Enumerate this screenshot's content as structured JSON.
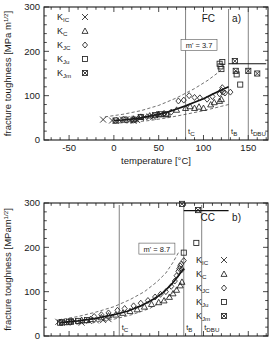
{
  "figure": {
    "panels": [
      "a",
      "b"
    ]
  },
  "chart_data": [
    {
      "type": "scatter",
      "panel_id": "a",
      "panel_label": "a)",
      "material_label": "FC",
      "title": "FC a)",
      "xlabel": "temperature  [°C]",
      "ylabel": "fracture toughness [MPa m",
      "ylabel_exponent": "1/2",
      "ylabel_tail": "]",
      "xlim": [
        -78,
        172
      ],
      "ylim": [
        0,
        300
      ],
      "xticks": [
        -50,
        0,
        50,
        100,
        150
      ],
      "xticklabels": [
        "-50",
        "0",
        "50",
        "100",
        "150"
      ],
      "yticks": [
        0,
        100,
        200,
        300
      ],
      "yticklabels": [
        "0",
        "100",
        "200",
        "300"
      ],
      "xminor_step": 10,
      "yminor_step": 20,
      "grid": false,
      "annotation": {
        "text": "m' = 3.7",
        "x": 95,
        "y": 213
      },
      "reference_lines": [
        {
          "name": "t_C",
          "label_main": "t",
          "label_sub": "C",
          "x": 80
        },
        {
          "name": "t_B",
          "label_main": "t",
          "label_sub": "B",
          "x": 128
        },
        {
          "name": "t_DBU",
          "label_main": "t",
          "label_sub": "DBU",
          "x": 150
        }
      ],
      "horizontal_bar": {
        "y": 172,
        "x_start": 128,
        "x_end": 170
      },
      "legend": {
        "position": "top-left",
        "entries": [
          {
            "label_main": "K",
            "label_sub": "IC",
            "symbol": "cross"
          },
          {
            "label_main": "K",
            "label_sub": "C",
            "symbol": "triangle"
          },
          {
            "label_main": "K",
            "label_sub": "JC",
            "symbol": "diamond"
          },
          {
            "label_main": "K",
            "label_sub": "Ju",
            "symbol": "square"
          },
          {
            "label_main": "K",
            "label_sub": "Jm",
            "symbol": "crossed-square"
          }
        ]
      },
      "series": [
        {
          "name": "K_IC",
          "symbol": "cross",
          "points": [
            [
              -12,
              46
            ],
            [
              -2,
              44
            ],
            [
              2,
              43
            ],
            [
              6,
              45
            ],
            [
              10,
              46
            ],
            [
              14,
              47
            ],
            [
              18,
              44
            ],
            [
              22,
              43
            ],
            [
              24,
              48
            ],
            [
              26,
              45
            ],
            [
              30,
              50
            ],
            [
              34,
              52
            ],
            [
              40,
              53
            ],
            [
              44,
              52
            ]
          ]
        },
        {
          "name": "K_C",
          "symbol": "triangle",
          "points": [
            [
              22,
              48
            ],
            [
              30,
              52
            ],
            [
              40,
              55
            ],
            [
              50,
              58
            ],
            [
              60,
              58
            ],
            [
              70,
              68
            ],
            [
              80,
              72
            ],
            [
              85,
              76
            ],
            [
              90,
              72
            ],
            [
              95,
              75
            ],
            [
              100,
              72
            ],
            [
              108,
              80
            ],
            [
              112,
              85
            ],
            [
              118,
              88
            ],
            [
              120,
              92
            ]
          ]
        },
        {
          "name": "K_JC",
          "symbol": "diamond",
          "points": [
            [
              48,
              58
            ],
            [
              56,
              60
            ],
            [
              64,
              63
            ],
            [
              72,
              88
            ],
            [
              78,
              90
            ],
            [
              84,
              100
            ],
            [
              90,
              96
            ],
            [
              96,
              95
            ],
            [
              104,
              92
            ],
            [
              110,
              98
            ],
            [
              118,
              104
            ],
            [
              120,
              112
            ],
            [
              121,
              118
            ],
            [
              122,
              108
            ],
            [
              124,
              106
            ],
            [
              130,
              108
            ]
          ]
        },
        {
          "name": "K_Ju",
          "symbol": "square",
          "points": [
            [
              2,
              44
            ],
            [
              12,
              46
            ],
            [
              22,
              46
            ],
            [
              30,
              52
            ],
            [
              118,
              172
            ],
            [
              119,
              166
            ],
            [
              120,
              160
            ],
            [
              121,
              176
            ],
            [
              137,
              148
            ],
            [
              141,
              125
            ]
          ]
        },
        {
          "name": "K_Jm",
          "symbol": "crossed-square",
          "points": [
            [
              46,
              56
            ],
            [
              52,
              58
            ],
            [
              58,
              58
            ],
            [
              135,
              178
            ],
            [
              136,
              156
            ],
            [
              150,
              156
            ],
            [
              160,
              150
            ]
          ]
        }
      ],
      "fit_curve": {
        "name": "master-curve",
        "style": "solid",
        "points": [
          [
            0,
            44
          ],
          [
            10,
            45
          ],
          [
            20,
            47
          ],
          [
            30,
            50
          ],
          [
            40,
            54
          ],
          [
            50,
            58
          ],
          [
            60,
            63
          ],
          [
            70,
            70
          ],
          [
            80,
            77
          ],
          [
            90,
            85
          ],
          [
            100,
            93
          ],
          [
            110,
            103
          ],
          [
            120,
            113
          ],
          [
            128,
            120
          ]
        ]
      },
      "bound_curves": [
        {
          "name": "upper-bound",
          "style": "dashed",
          "points": [
            [
              -10,
              52
            ],
            [
              10,
              58
            ],
            [
              30,
              66
            ],
            [
              50,
              78
            ],
            [
              70,
              95
            ],
            [
              90,
              116
            ],
            [
              105,
              135
            ],
            [
              115,
              150
            ],
            [
              122,
              162
            ]
          ]
        },
        {
          "name": "lower-bound",
          "style": "dashed",
          "points": [
            [
              0,
              38
            ],
            [
              20,
              40
            ],
            [
              40,
              44
            ],
            [
              60,
              50
            ],
            [
              80,
              58
            ],
            [
              100,
              66
            ],
            [
              120,
              76
            ],
            [
              128,
              80
            ]
          ]
        }
      ]
    },
    {
      "type": "scatter",
      "panel_id": "b",
      "panel_label": "b)",
      "material_label": "CC",
      "title": "CC b)",
      "xlabel": "",
      "ylabel": "fracture toughness  [MPam",
      "ylabel_exponent": "1/2",
      "ylabel_tail": "]",
      "xlim": [
        -78,
        172
      ],
      "ylim": [
        0,
        300
      ],
      "xticks": [
        -50,
        0,
        50,
        100,
        150
      ],
      "xticklabels": [
        "-50",
        "0",
        "50",
        "100",
        "150"
      ],
      "yticks": [
        0,
        100,
        200,
        300
      ],
      "yticklabels": [
        "0",
        "100",
        "200",
        "300"
      ],
      "xminor_step": 10,
      "yminor_step": 20,
      "grid": false,
      "annotation": {
        "text": "m' = 8.7",
        "x": 48,
        "y": 196
      },
      "reference_lines": [
        {
          "name": "t_C",
          "label_main": "t",
          "label_sub": "C",
          "x": 6
        },
        {
          "name": "t_B",
          "label_main": "t",
          "label_sub": "B",
          "x": 78
        },
        {
          "name": "t_DBU",
          "label_main": "t",
          "label_sub": "DBU",
          "x": 98
        }
      ],
      "horizontal_bar": {
        "y": 283,
        "x_start": 78,
        "x_end": 128
      },
      "legend": {
        "position": "center-right",
        "entries": [
          {
            "label_main": "K",
            "label_sub": "IC",
            "symbol": "cross"
          },
          {
            "label_main": "K",
            "label_sub": "C",
            "symbol": "triangle"
          },
          {
            "label_main": "K",
            "label_sub": "JC",
            "symbol": "diamond"
          },
          {
            "label_main": "K",
            "label_sub": "Ju",
            "symbol": "square"
          },
          {
            "label_main": "K",
            "label_sub": "Jm",
            "symbol": "crossed-square"
          }
        ]
      },
      "series": [
        {
          "name": "K_IC",
          "symbol": "cross",
          "points": [
            [
              -62,
              32
            ],
            [
              -52,
              30
            ],
            [
              -44,
              34
            ],
            [
              -36,
              30
            ],
            [
              -28,
              34
            ],
            [
              -20,
              35
            ],
            [
              -12,
              36
            ],
            [
              -6,
              38
            ]
          ]
        },
        {
          "name": "K_C",
          "symbol": "triangle",
          "points": [
            [
              -36,
              36
            ],
            [
              -26,
              38
            ],
            [
              -14,
              42
            ],
            [
              -6,
              46
            ],
            [
              2,
              48
            ],
            [
              10,
              52
            ],
            [
              18,
              56
            ],
            [
              26,
              60
            ],
            [
              34,
              66
            ],
            [
              42,
              72
            ],
            [
              50,
              76
            ],
            [
              56,
              80
            ],
            [
              62,
              88
            ],
            [
              66,
              96
            ],
            [
              70,
              104
            ],
            [
              74,
              114
            ],
            [
              76,
              122
            ]
          ]
        },
        {
          "name": "K_JC",
          "symbol": "diamond",
          "points": [
            [
              -22,
              44
            ],
            [
              -14,
              48
            ],
            [
              -6,
              52
            ],
            [
              4,
              58
            ],
            [
              12,
              62
            ],
            [
              22,
              68
            ],
            [
              30,
              74
            ],
            [
              38,
              80
            ],
            [
              46,
              88
            ],
            [
              52,
              94
            ],
            [
              58,
              100
            ],
            [
              64,
              112
            ],
            [
              68,
              124
            ],
            [
              70,
              136
            ],
            [
              72,
              146
            ],
            [
              73,
              152
            ],
            [
              74,
              158
            ],
            [
              75,
              162
            ],
            [
              76,
              150
            ],
            [
              78,
              170
            ]
          ]
        },
        {
          "name": "K_Ju",
          "symbol": "square",
          "points": [
            [
              -60,
              30
            ],
            [
              -50,
              32
            ],
            [
              -40,
              34
            ],
            [
              -30,
              36
            ],
            [
              78,
              188
            ],
            [
              92,
              210
            ]
          ]
        },
        {
          "name": "K_Jm",
          "symbol": "crossed-square",
          "points": [
            [
              -58,
              31
            ],
            [
              -48,
              33
            ],
            [
              76,
              298
            ],
            [
              94,
              284
            ]
          ]
        }
      ],
      "fit_curve": {
        "name": "master-curve",
        "style": "solid",
        "points": [
          [
            -60,
            30
          ],
          [
            -40,
            34
          ],
          [
            -20,
            40
          ],
          [
            0,
            48
          ],
          [
            15,
            56
          ],
          [
            30,
            68
          ],
          [
            45,
            84
          ],
          [
            55,
            98
          ],
          [
            65,
            118
          ],
          [
            72,
            136
          ],
          [
            78,
            152
          ]
        ]
      },
      "bound_curves": [
        {
          "name": "upper-bound",
          "style": "dashed",
          "points": [
            [
              -62,
              36
            ],
            [
              -40,
              44
            ],
            [
              -20,
              54
            ],
            [
              0,
              66
            ],
            [
              18,
              82
            ],
            [
              34,
              100
            ],
            [
              48,
              122
            ],
            [
              58,
              142
            ],
            [
              66,
              166
            ],
            [
              72,
              188
            ]
          ]
        },
        {
          "name": "lower-bound",
          "style": "dashed",
          "points": [
            [
              -60,
              24
            ],
            [
              -40,
              27
            ],
            [
              -20,
              32
            ],
            [
              0,
              38
            ],
            [
              20,
              48
            ],
            [
              40,
              62
            ],
            [
              56,
              80
            ],
            [
              68,
              102
            ],
            [
              76,
              122
            ]
          ]
        }
      ]
    }
  ]
}
